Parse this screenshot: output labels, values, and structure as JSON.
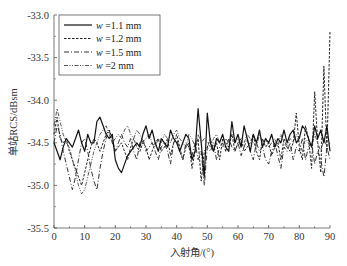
{
  "chart_data": {
    "type": "line",
    "title": "",
    "xlabel": "入射角/(°)",
    "ylabel": "单站RCS/dBsm",
    "xlim": [
      0,
      90
    ],
    "ylim": [
      -35.5,
      -33.0
    ],
    "xticks": [
      0,
      10,
      20,
      30,
      40,
      50,
      60,
      70,
      80,
      90
    ],
    "yticks": [
      -33.0,
      -33.5,
      -34.0,
      -34.5,
      -35.0,
      -35.5
    ],
    "ytick_labels": [
      "-33.0",
      "-33.5",
      "-34.0",
      "-34.5",
      "-35.0",
      "-35.5"
    ],
    "grid": false,
    "legend_position": "upper left",
    "x": [
      0,
      1,
      2,
      3,
      4,
      5,
      6,
      7,
      8,
      9,
      10,
      11,
      12,
      13,
      14,
      15,
      16,
      17,
      18,
      19,
      20,
      21,
      22,
      23,
      24,
      25,
      26,
      27,
      28,
      29,
      30,
      31,
      32,
      33,
      34,
      35,
      36,
      37,
      38,
      39,
      40,
      41,
      42,
      43,
      44,
      45,
      46,
      47,
      48,
      49,
      50,
      51,
      52,
      53,
      54,
      55,
      56,
      57,
      58,
      59,
      60,
      61,
      62,
      63,
      64,
      65,
      66,
      67,
      68,
      69,
      70,
      71,
      72,
      73,
      74,
      75,
      76,
      77,
      78,
      79,
      80,
      81,
      82,
      83,
      84,
      85,
      86,
      87,
      88,
      89,
      90
    ],
    "series": [
      {
        "name": "w =1.1 mm",
        "legend_prefix": "w",
        "legend_suffix": " =1.1 mm",
        "style": "solid",
        "values": [
          -34.5,
          -34.6,
          -34.7,
          -34.55,
          -34.45,
          -34.5,
          -34.55,
          -34.45,
          -34.35,
          -34.5,
          -34.6,
          -34.4,
          -34.5,
          -34.5,
          -34.25,
          -34.2,
          -34.3,
          -34.4,
          -34.45,
          -34.4,
          -34.7,
          -34.8,
          -34.85,
          -34.75,
          -34.65,
          -34.6,
          -34.55,
          -34.5,
          -34.55,
          -34.4,
          -34.3,
          -34.45,
          -34.35,
          -34.5,
          -34.6,
          -34.45,
          -34.5,
          -34.55,
          -34.35,
          -34.45,
          -34.5,
          -34.6,
          -34.5,
          -34.4,
          -34.45,
          -34.7,
          -34.6,
          -34.1,
          -34.5,
          -34.9,
          -34.15,
          -34.5,
          -34.6,
          -34.45,
          -34.5,
          -34.4,
          -34.55,
          -34.6,
          -34.25,
          -34.5,
          -34.4,
          -34.55,
          -34.3,
          -34.45,
          -34.6,
          -34.4,
          -34.5,
          -34.35,
          -34.55,
          -34.45,
          -34.5,
          -34.4,
          -34.55,
          -34.45,
          -34.5,
          -34.35,
          -34.5,
          -34.4,
          -34.35,
          -34.5,
          -34.45,
          -34.3,
          -34.35,
          -34.45,
          -34.55,
          -34.3,
          -34.45,
          -34.35,
          -34.5,
          -34.3,
          -34.6
        ]
      },
      {
        "name": "w =1.2 mm",
        "legend_prefix": "w",
        "legend_suffix": " =1.2 mm",
        "style": "dashed",
        "values": [
          -34.4,
          -34.2,
          -34.45,
          -34.5,
          -34.45,
          -34.6,
          -34.7,
          -34.8,
          -34.9,
          -35.0,
          -34.85,
          -34.7,
          -34.55,
          -34.45,
          -34.5,
          -34.6,
          -34.5,
          -34.4,
          -34.35,
          -34.45,
          -34.6,
          -34.55,
          -34.5,
          -34.6,
          -34.7,
          -34.55,
          -34.45,
          -34.55,
          -34.6,
          -34.5,
          -34.55,
          -34.7,
          -34.6,
          -34.5,
          -34.45,
          -34.6,
          -34.55,
          -34.45,
          -34.65,
          -34.5,
          -34.4,
          -34.55,
          -34.7,
          -34.55,
          -34.5,
          -34.8,
          -34.6,
          -34.45,
          -34.95,
          -34.6,
          -34.55,
          -34.45,
          -34.6,
          -34.5,
          -34.7,
          -34.45,
          -34.5,
          -34.55,
          -34.4,
          -34.6,
          -34.5,
          -34.45,
          -34.6,
          -34.55,
          -34.5,
          -34.4,
          -34.6,
          -34.7,
          -34.45,
          -34.55,
          -34.5,
          -34.65,
          -34.55,
          -34.5,
          -34.7,
          -34.45,
          -34.55,
          -34.6,
          -34.5,
          -34.15,
          -34.55,
          -34.7,
          -34.3,
          -34.45,
          -34.8,
          -33.9,
          -34.5,
          -34.85,
          -33.6,
          -34.6,
          -33.2
        ]
      },
      {
        "name": "w =1.5 mm",
        "legend_prefix": "w",
        "legend_suffix": " =1.5 mm",
        "style": "dashdot",
        "values": [
          -34.5,
          -34.3,
          -34.4,
          -34.6,
          -34.75,
          -34.9,
          -35.05,
          -34.9,
          -34.7,
          -34.5,
          -34.45,
          -34.6,
          -34.8,
          -34.95,
          -35.05,
          -34.8,
          -34.6,
          -34.45,
          -34.35,
          -34.5,
          -34.6,
          -34.5,
          -34.4,
          -34.5,
          -34.55,
          -34.45,
          -34.6,
          -34.7,
          -34.5,
          -34.45,
          -34.6,
          -34.55,
          -34.5,
          -34.6,
          -34.7,
          -34.55,
          -34.5,
          -34.6,
          -34.75,
          -34.5,
          -34.45,
          -34.6,
          -34.7,
          -34.5,
          -34.55,
          -34.65,
          -34.5,
          -34.7,
          -34.6,
          -35.0,
          -34.55,
          -34.6,
          -34.5,
          -34.7,
          -34.55,
          -34.5,
          -34.6,
          -34.45,
          -34.55,
          -34.6,
          -34.5,
          -34.65,
          -34.55,
          -34.45,
          -34.6,
          -34.7,
          -34.5,
          -34.6,
          -34.55,
          -34.7,
          -34.75,
          -34.6,
          -34.5,
          -34.65,
          -34.8,
          -34.55,
          -34.6,
          -34.5,
          -34.7,
          -34.55,
          -34.6,
          -34.45,
          -34.7,
          -34.55,
          -34.5,
          -34.75,
          -34.6,
          -34.7,
          -34.9,
          -34.55,
          -34.7
        ]
      },
      {
        "name": "w =2 mm",
        "legend_prefix": "w",
        "legend_suffix": " =2 mm",
        "style": "dashdotdot",
        "values": [
          -34.3,
          -34.1,
          -34.25,
          -34.4,
          -34.5,
          -34.55,
          -34.7,
          -34.85,
          -35.0,
          -35.1,
          -35.05,
          -34.9,
          -34.75,
          -34.6,
          -34.5,
          -34.4,
          -34.35,
          -34.3,
          -34.4,
          -34.5,
          -34.45,
          -34.4,
          -34.45,
          -34.35,
          -34.3,
          -34.4,
          -34.45,
          -34.35,
          -34.4,
          -34.5,
          -34.45,
          -34.4,
          -34.5,
          -34.55,
          -34.45,
          -34.5,
          -34.4,
          -34.45,
          -34.5,
          -34.4,
          -34.35,
          -34.45,
          -34.5,
          -34.55,
          -34.4,
          -34.45,
          -34.55,
          -34.4,
          -34.5,
          -34.45,
          -34.5,
          -34.55,
          -34.45,
          -34.4,
          -34.5,
          -34.55,
          -34.45,
          -34.5,
          -34.4,
          -34.5,
          -34.45,
          -34.55,
          -34.5,
          -34.4,
          -34.45,
          -34.5,
          -34.55,
          -34.4,
          -34.5,
          -34.45,
          -34.55,
          -34.5,
          -34.45,
          -34.55,
          -34.4,
          -34.5,
          -34.55,
          -34.45,
          -34.5,
          -34.4,
          -34.5,
          -34.6,
          -34.45,
          -34.5,
          -34.55,
          -34.4,
          -34.5,
          -34.6,
          -34.45,
          -34.55,
          -34.5
        ]
      }
    ]
  }
}
